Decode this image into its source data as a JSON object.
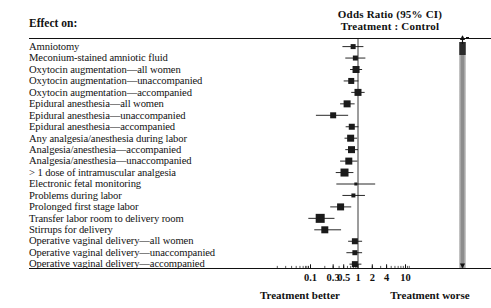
{
  "header": {
    "column_header": "Effect on:",
    "title_line1": "Odds Ratio (95% CI)",
    "title_line2": "Treatment : Control"
  },
  "axis": {
    "caption_left": "Treatment better",
    "caption_right": "Treatment worse",
    "tick_labels": [
      "0.1",
      "0.3",
      "0.5",
      "1",
      "2",
      "4",
      "10"
    ],
    "tick_values": [
      0.1,
      0.3,
      0.5,
      1,
      2,
      4,
      10
    ],
    "scale": "log10",
    "range": [
      0.07,
      13
    ],
    "reference_line": 1
  },
  "colors": {
    "ink": "#111111",
    "marker": "#1a1a1a",
    "band": "#9a9a9a",
    "rule": "#111111"
  },
  "chart_data": {
    "type": "forest",
    "title": "Odds Ratio (95% CI) Treatment : Control",
    "xlabel": "Odds Ratio (95% CI)",
    "ylabel": "Effect on:",
    "xlim": [
      0.07,
      13
    ],
    "xscale": "log10",
    "xticks": [
      0.1,
      0.3,
      0.5,
      1,
      2,
      4,
      10
    ],
    "xticklabels": [
      "0.1",
      "0.3",
      "0.5",
      "1",
      "2",
      "4",
      "10"
    ],
    "grid": false,
    "legend": "none",
    "reference_line": 1,
    "annotations": [
      "Treatment better",
      "Treatment worse"
    ],
    "categories": [
      "Amniotomy",
      "Meconium-stained amniotic fluid",
      "Oxytocin augmentation—all women",
      "Oxytocin augmentation—unaccompanied",
      "Oxytocin augmentation—accompanied",
      "Epidural anesthesia—all women",
      "Epidural anesthesia—unaccompanied",
      "Epidural anesthesia—accompanied",
      "Any analgesia/anesthesia during labor",
      "Analgesia/anesthesia—accompanied",
      "Analgesia/anesthesia—unaccompanied",
      "> 1 dose of intramuscular analgesia",
      "Electronic fetal monitoring",
      "Problems during labor",
      "Prolonged first stage labor",
      "Transfer labor room to delivery room",
      "Stirrups for delivery",
      "Operative vaginal delivery—all women",
      "Operative vaginal delivery—unaccompanied",
      "Operative vaginal delivery—accompanied"
    ],
    "points": [
      {
        "label": "Amniotomy",
        "or": 0.79,
        "lo": 0.47,
        "hi": 1.3,
        "size": 5
      },
      {
        "label": "Meconium-stained amniotic fluid",
        "or": 0.88,
        "lo": 0.54,
        "hi": 1.43,
        "size": 5
      },
      {
        "label": "Oxytocin augmentation—all women",
        "or": 0.91,
        "lo": 0.68,
        "hi": 1.22,
        "size": 7
      },
      {
        "label": "Oxytocin augmentation—unaccompanied",
        "or": 0.72,
        "lo": 0.5,
        "hi": 1.02,
        "size": 6
      },
      {
        "label": "Oxytocin augmentation—accompanied",
        "or": 1.0,
        "lo": 0.72,
        "hi": 1.38,
        "size": 7
      },
      {
        "label": "Epidural anesthesia—all women",
        "or": 0.59,
        "lo": 0.42,
        "hi": 0.85,
        "size": 7
      },
      {
        "label": "Epidural anesthesia—unaccompanied",
        "or": 0.3,
        "lo": 0.13,
        "hi": 0.62,
        "size": 6
      },
      {
        "label": "Epidural anesthesia—accompanied",
        "or": 0.74,
        "lo": 0.55,
        "hi": 1.02,
        "size": 6
      },
      {
        "label": "Any analgesia/anesthesia during labor",
        "or": 0.7,
        "lo": 0.52,
        "hi": 0.96,
        "size": 7
      },
      {
        "label": "Analgesia/anesthesia—accompanied",
        "or": 0.73,
        "lo": 0.54,
        "hi": 1.0,
        "size": 7
      },
      {
        "label": "Analgesia/anesthesia—unaccompanied",
        "or": 0.64,
        "lo": 0.42,
        "hi": 0.97,
        "size": 7
      },
      {
        "label": "> 1 dose of intramuscular analgesia",
        "or": 0.52,
        "lo": 0.34,
        "hi": 0.8,
        "size": 8
      },
      {
        "label": "Electronic fetal monitoring",
        "or": 0.9,
        "lo": 0.35,
        "hi": 2.3,
        "size": 3
      },
      {
        "label": "Problems during labor",
        "or": 0.8,
        "lo": 0.47,
        "hi": 1.4,
        "size": 4
      },
      {
        "label": "Prolonged first stage labor",
        "or": 0.43,
        "lo": 0.26,
        "hi": 0.72,
        "size": 7
      },
      {
        "label": "Transfer labor room to delivery room",
        "or": 0.16,
        "lo": 0.09,
        "hi": 0.32,
        "size": 9
      },
      {
        "label": "Stirrups for delivery",
        "or": 0.2,
        "lo": 0.12,
        "hi": 0.44,
        "size": 7
      },
      {
        "label": "Operative vaginal delivery—all women",
        "or": 0.86,
        "lo": 0.62,
        "hi": 1.22,
        "size": 6
      },
      {
        "label": "Operative vaginal delivery—unaccompanied",
        "or": 0.86,
        "lo": 0.57,
        "hi": 1.22,
        "size": 5
      },
      {
        "label": "Operative vaginal delivery—accompanied",
        "or": 0.86,
        "lo": 0.66,
        "hi": 1.18,
        "size": 6
      }
    ]
  }
}
